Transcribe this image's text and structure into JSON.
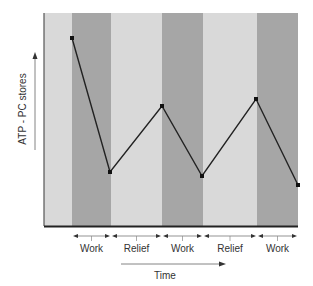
{
  "chart_data": {
    "type": "line",
    "title": "",
    "xlabel": "Time",
    "ylabel": "ATP - PC stores",
    "grid": false,
    "legend": null,
    "phases": [
      {
        "label": "",
        "type": "rest",
        "x0": 44,
        "x1": 72
      },
      {
        "label": "Work",
        "type": "work",
        "x0": 72,
        "x1": 111
      },
      {
        "label": "Relief",
        "type": "relief",
        "x0": 111,
        "x1": 162
      },
      {
        "label": "Work",
        "type": "work",
        "x0": 162,
        "x1": 203
      },
      {
        "label": "Relief",
        "type": "relief",
        "x0": 203,
        "x1": 257
      },
      {
        "label": "Work",
        "type": "work",
        "x0": 257,
        "x1": 298
      }
    ],
    "x_segment_labels": [
      "Work",
      "Relief",
      "Work",
      "Relief",
      "Work"
    ],
    "series": [
      {
        "name": "ATP - PC stores",
        "points": [
          {
            "phase": "start of work 1",
            "value": 90
          },
          {
            "phase": "end of work 1",
            "value": 26
          },
          {
            "phase": "end of relief 1",
            "value": 57
          },
          {
            "phase": "end of work 2",
            "value": 24
          },
          {
            "phase": "end of relief 2",
            "value": 60
          },
          {
            "phase": "end of work 3",
            "value": 19
          }
        ]
      }
    ],
    "ylim": [
      0,
      100
    ],
    "pixel_points": [
      [
        72,
        38
      ],
      [
        110,
        172
      ],
      [
        162,
        106
      ],
      [
        202,
        176
      ],
      [
        256,
        99
      ],
      [
        298,
        185
      ]
    ],
    "colors": {
      "work_band": "#a6a6a6",
      "relief_band": "#d9d9d9",
      "line": "#222222"
    }
  }
}
